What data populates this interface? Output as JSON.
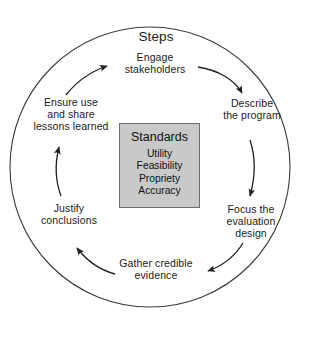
{
  "figure": {
    "name": "framework-for-program-evaluation-cycle",
    "title": "Steps",
    "outer_circle": {
      "cx": 150,
      "cy": 167,
      "r": 140,
      "stroke": "#333333"
    },
    "colors": {
      "background": "#ffffff",
      "text": "#1a1a1a",
      "line": "#333333",
      "box_fill": "#c9c9c9",
      "box_border": "#6e6e6e"
    }
  },
  "steps": [
    {
      "id": "engage",
      "label": "Engage\nstakeholders",
      "order": 1
    },
    {
      "id": "describe",
      "label": "Describe\nthe program",
      "order": 2
    },
    {
      "id": "focus",
      "label": "Focus the\nevaluation\ndesign",
      "order": 3
    },
    {
      "id": "gather",
      "label": "Gather credible\nevidence",
      "order": 4
    },
    {
      "id": "justify",
      "label": "Justify\nconclusions",
      "order": 5
    },
    {
      "id": "ensure",
      "label": "Ensure use\nand share\nlessons learned",
      "order": 6
    }
  ],
  "standards": {
    "title": "Standards",
    "items": [
      {
        "label": "Utility"
      },
      {
        "label": "Feasibility"
      },
      {
        "label": "Propriety"
      },
      {
        "label": "Accuracy"
      }
    ]
  },
  "arrows": [
    {
      "id": "engage-to-describe",
      "from": "engage",
      "to": "describe"
    },
    {
      "id": "describe-to-focus",
      "from": "describe",
      "to": "focus"
    },
    {
      "id": "focus-to-gather",
      "from": "focus",
      "to": "gather"
    },
    {
      "id": "gather-to-justify",
      "from": "gather",
      "to": "justify"
    },
    {
      "id": "justify-to-ensure",
      "from": "justify",
      "to": "ensure"
    },
    {
      "id": "ensure-to-engage",
      "from": "ensure",
      "to": "engage"
    }
  ]
}
